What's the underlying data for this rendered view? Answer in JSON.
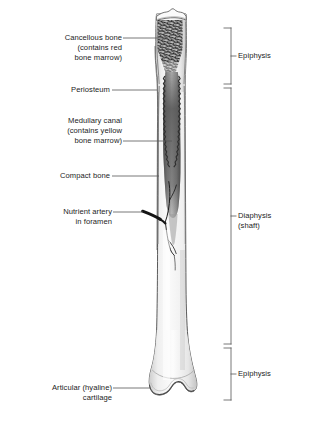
{
  "figure": {
    "background_color": "#ffffff",
    "ink_color": "#1c1c1c"
  },
  "left_labels": [
    {
      "id": "cancellous-bone",
      "lines": [
        "Cancellous bone",
        "(contains red",
        "bone marrow)"
      ],
      "text": "Cancellous bone\n(contains red\nbone marrow)"
    },
    {
      "id": "periosteum",
      "lines": [
        "Periosteum"
      ],
      "text": "Periosteum"
    },
    {
      "id": "medullary-canal",
      "lines": [
        "Medullary canal",
        "(contains yellow",
        "bone marrow)"
      ],
      "text": "Medullary canal\n(contains yellow\nbone marrow)"
    },
    {
      "id": "compact-bone",
      "lines": [
        "Compact bone"
      ],
      "text": "Compact bone"
    },
    {
      "id": "nutrient-artery",
      "lines": [
        "Nutrient artery",
        "in foramen"
      ],
      "text": "Nutrient artery\nin foramen"
    },
    {
      "id": "articular-cartilage",
      "lines": [
        "Articular (hyaline)",
        "cartilage"
      ],
      "text": "Articular (hyaline)\ncartilage"
    }
  ],
  "right_labels": [
    {
      "id": "epiphysis-proximal",
      "text": "Epiphysis"
    },
    {
      "id": "diaphysis",
      "text": "Diaphysis\n(shaft)"
    },
    {
      "id": "epiphysis-distal",
      "text": "Epiphysis"
    }
  ],
  "brackets": [
    {
      "id": "bracket-epiphysis-proximal",
      "region": "Epiphysis",
      "top": 28,
      "bottom": 84
    },
    {
      "id": "bracket-diaphysis",
      "region": "Diaphysis (shaft)",
      "top": 88,
      "bottom": 344
    },
    {
      "id": "bracket-epiphysis-distal",
      "region": "Epiphysis",
      "top": 348,
      "bottom": 400
    }
  ],
  "colors": {
    "outline": "#4a4a4a",
    "cancellous": "#2b2b2b",
    "marrow_canal": "#6e6e6e",
    "cortex_light": "#f2f2f2",
    "cortex_shade": "#cfcfcf",
    "artery": "#1a1a1a",
    "leader_line": "#555555"
  }
}
